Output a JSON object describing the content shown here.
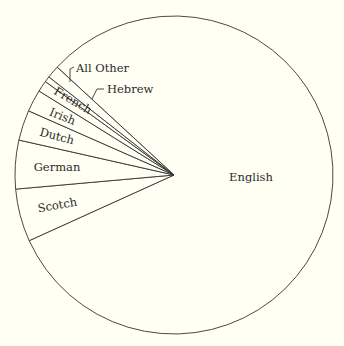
{
  "chart_data": {
    "type": "pie",
    "title": "",
    "categories": [
      "English",
      "Scotch",
      "German",
      "Dutch",
      "Irish",
      "French",
      "Hebrew",
      "All Other"
    ],
    "values": [
      81.4,
      5.4,
      4.9,
      3.1,
      2.2,
      1.1,
      0.6,
      1.3
    ],
    "unit": "percent (estimated from slice angles)",
    "legend": "none (direct labels)",
    "slices": [
      {
        "label": "English",
        "start_deg": 204.4,
        "end_deg": 497.3,
        "value": 81.4
      },
      {
        "label": "Scotch",
        "start_deg": 185.1,
        "end_deg": 204.4,
        "value": 5.4
      },
      {
        "label": "German",
        "start_deg": 167.3,
        "end_deg": 185.1,
        "value": 4.9
      },
      {
        "label": "Dutch",
        "start_deg": 156.2,
        "end_deg": 167.3,
        "value": 3.1
      },
      {
        "label": "Irish",
        "start_deg": 148.1,
        "end_deg": 156.2,
        "value": 2.2
      },
      {
        "label": "French",
        "start_deg": 144.0,
        "end_deg": 148.1,
        "value": 1.1
      },
      {
        "label": "Hebrew",
        "start_deg": 141.9,
        "end_deg": 144.0,
        "value": 0.6
      },
      {
        "label": "All Other",
        "start_deg": 137.3,
        "end_deg": 141.9,
        "value": 1.3
      }
    ]
  },
  "labels": {
    "english": "English",
    "scotch": "Scotch",
    "german": "German",
    "dutch": "Dutch",
    "irish": "Irish",
    "french": "French",
    "hebrew": "Hebrew",
    "all_other": "All Other"
  },
  "colors": {
    "background": "#fffff4",
    "stroke": "#333333",
    "text": "#2a2a2a"
  }
}
